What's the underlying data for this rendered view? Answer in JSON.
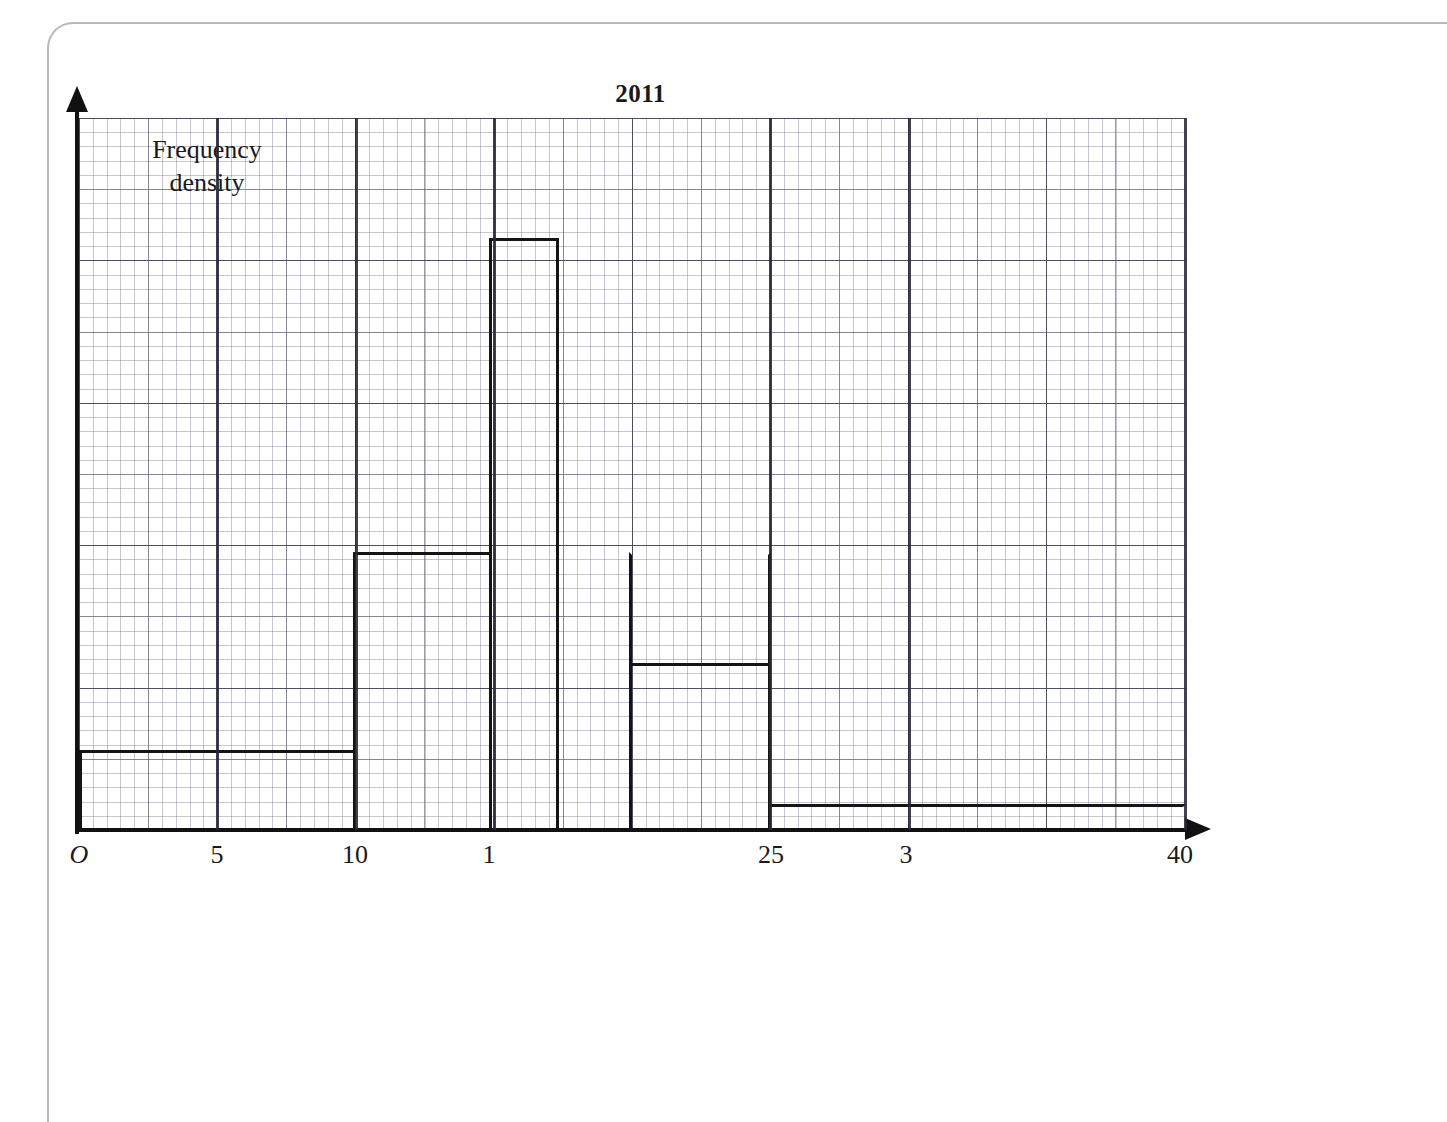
{
  "page": {
    "frame_color": "#b9b9b9"
  },
  "chart_data": {
    "type": "bar",
    "title": "2011",
    "xlabel": "Time (seconds)",
    "ylabel": "Frequency density",
    "ylabel_lines": [
      "Frequency",
      "density"
    ],
    "xlim": [
      0,
      40
    ],
    "ylim": [
      0,
      5
    ],
    "grid": true,
    "legend": null,
    "tick_labels": [
      "O",
      "5",
      "10",
      "1",
      "25",
      "3",
      "40"
    ],
    "tick_values": [
      0,
      5,
      10,
      15,
      25,
      30,
      40
    ],
    "axis_note": "tick labels for 15 and 30 render truncated as '1' and '3'",
    "bins": [
      {
        "label": "0 - 10",
        "start": 0,
        "end": 10,
        "frequency_density": 0.55
      },
      {
        "label": "10 - 15",
        "start": 10,
        "end": 15,
        "frequency_density": 1.95
      },
      {
        "label": "15 - 17",
        "start": 15,
        "end": 17,
        "frequency_density": 4.15
      },
      {
        "label": "20 - 25",
        "start": 20,
        "end": 25,
        "frequency_density": 1.17
      },
      {
        "label": "25 - 40",
        "start": 25,
        "end": 40,
        "frequency_density": 0.18
      }
    ],
    "categories": [
      "0-10",
      "10-15",
      "15-17",
      "20-25",
      "25-40"
    ],
    "values": [
      0.55,
      1.95,
      4.15,
      1.17,
      0.18
    ]
  },
  "colors": {
    "bar_outline": "#141414",
    "axis": "#111111",
    "grid_major": "#46465a",
    "grid_minor": "#78788c"
  }
}
